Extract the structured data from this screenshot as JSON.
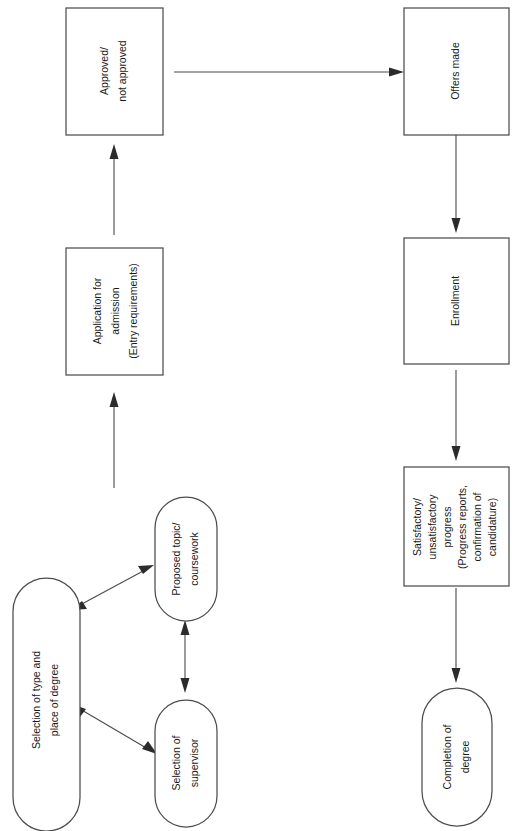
{
  "diagram": {
    "orientation": "rotated-90-counterclockwise",
    "colors": {
      "background": "#ffffff",
      "node_stroke": "#4d4d4d",
      "node_fill": "#ffffff",
      "text": "#1a1a1a",
      "edge": "#4a4a4a",
      "arrowhead": "#2b2b2b"
    },
    "nodes": [
      {
        "id": "selection-type-place",
        "shape": "stadium",
        "lines": [
          "Selection of type and",
          "place of degree"
        ]
      },
      {
        "id": "proposed-topic",
        "shape": "stadium",
        "lines": [
          "Proposed topic/",
          "coursework"
        ]
      },
      {
        "id": "selection-supervisor",
        "shape": "stadium",
        "lines": [
          "Selection of",
          "supervisor"
        ]
      },
      {
        "id": "application-admission",
        "shape": "rectangle",
        "lines": [
          "Application for",
          "admission",
          "(Entry requirements)"
        ]
      },
      {
        "id": "approved-not-approved",
        "shape": "rectangle",
        "lines": [
          "Approved/",
          "not approved"
        ]
      },
      {
        "id": "offers-made",
        "shape": "rectangle",
        "lines": [
          "Offers made"
        ]
      },
      {
        "id": "enrollment",
        "shape": "rectangle",
        "lines": [
          "Enrollment"
        ]
      },
      {
        "id": "progress",
        "shape": "rectangle",
        "lines": [
          "Satisfactory/",
          "unsatisfactory",
          "progress",
          "(Progress reports,",
          "confirmation of",
          "candidature)"
        ]
      },
      {
        "id": "completion",
        "shape": "stadium",
        "lines": [
          "Completion of",
          "degree"
        ]
      }
    ],
    "edges": [
      {
        "id": "edge-type-to-topic",
        "from": "selection-type-place",
        "to": "proposed-topic",
        "style": "double-headed-diagonal"
      },
      {
        "id": "edge-type-to-supervisor",
        "from": "selection-type-place",
        "to": "selection-supervisor",
        "style": "double-headed-diagonal"
      },
      {
        "id": "edge-topic-supervisor",
        "from": "proposed-topic",
        "to": "selection-supervisor",
        "style": "double-headed-vertical"
      },
      {
        "id": "edge-topic-to-application",
        "from": "proposed-topic",
        "to": "application-admission",
        "style": "single-arrow"
      },
      {
        "id": "edge-application-to-approved",
        "from": "application-admission",
        "to": "approved-not-approved",
        "style": "single-arrow"
      },
      {
        "id": "edge-approved-to-offers",
        "from": "approved-not-approved",
        "to": "offers-made",
        "style": "single-arrow"
      },
      {
        "id": "edge-offers-to-enrollment",
        "from": "offers-made",
        "to": "enrollment",
        "style": "single-arrow"
      },
      {
        "id": "edge-enrollment-to-progress",
        "from": "enrollment",
        "to": "progress",
        "style": "single-arrow"
      },
      {
        "id": "edge-progress-to-completion",
        "from": "progress",
        "to": "completion",
        "style": "single-arrow"
      }
    ]
  }
}
